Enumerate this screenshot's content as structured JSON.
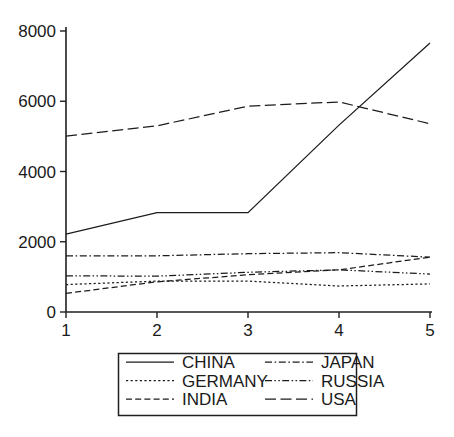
{
  "chart_data": {
    "type": "line",
    "title": "",
    "subtitle": "",
    "xlabel": "",
    "ylabel": "",
    "x": [
      1,
      2,
      3,
      4,
      5
    ],
    "xticklabels": [
      "1",
      "2",
      "3",
      "4",
      "5"
    ],
    "yticklabels": [
      "0",
      "2000",
      "4000",
      "6000",
      "8000"
    ],
    "yticks": [
      0,
      2000,
      4000,
      6000,
      8000
    ],
    "xlim": [
      1,
      5
    ],
    "ylim": [
      0,
      8000
    ],
    "grid": false,
    "legend_position": "below-center",
    "legend_columns": 2,
    "series": [
      {
        "name": "CHINA",
        "linestyle": "solid",
        "values": [
          2220,
          2830,
          2830,
          5320,
          7660
        ]
      },
      {
        "name": "GERMANY",
        "linestyle": "dotted",
        "values": [
          780,
          880,
          880,
          740,
          800
        ]
      },
      {
        "name": "INDIA",
        "linestyle": "dashed",
        "values": [
          530,
          860,
          1060,
          1200,
          1560
        ]
      },
      {
        "name": "JAPAN",
        "linestyle": "dashdot",
        "values": [
          1600,
          1600,
          1660,
          1690,
          1560
        ]
      },
      {
        "name": "RUSSIA",
        "linestyle": "dashdotdot",
        "values": [
          1030,
          1020,
          1130,
          1200,
          1080
        ]
      },
      {
        "name": "USA",
        "linestyle": "longdash",
        "values": [
          5010,
          5300,
          5860,
          5980,
          5360
        ]
      }
    ]
  },
  "legend": {
    "entries": [
      {
        "label": "CHINA",
        "series": "CHINA"
      },
      {
        "label": "JAPAN",
        "series": "JAPAN"
      },
      {
        "label": "GERMANY",
        "series": "GERMANY"
      },
      {
        "label": "RUSSIA",
        "series": "RUSSIA"
      },
      {
        "label": "INDIA",
        "series": "INDIA"
      },
      {
        "label": "USA",
        "series": "USA"
      }
    ]
  },
  "colors": {
    "ink": "#1c1c1c",
    "background": "#ffffff",
    "axis": "#1f1f1f"
  }
}
